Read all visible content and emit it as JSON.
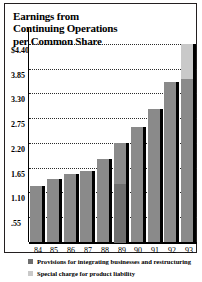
{
  "chart_data": {
    "type": "bar",
    "title": "Earnings from Continuing Operations per Common Share",
    "title_lines": [
      "Earnings from",
      "Continuing Operations",
      "per Common Share"
    ],
    "xlabel": "",
    "ylabel": "",
    "categories": [
      "84",
      "85",
      "86",
      "87",
      "88",
      "89",
      "90",
      "91",
      "92",
      "93"
    ],
    "values": [
      1.25,
      1.4,
      1.52,
      1.58,
      1.85,
      2.2,
      2.55,
      2.95,
      3.55,
      4.4
    ],
    "ylim": [
      0,
      4.75
    ],
    "ytick_values": [
      0.55,
      1.1,
      1.65,
      2.2,
      2.75,
      3.3,
      3.85,
      4.4
    ],
    "ytick_labels": [
      ".55",
      "1.10",
      "1.65",
      "2.20",
      "2.75",
      "3.30",
      "3.85",
      "$4.40"
    ],
    "grid": true,
    "grid_style": "dotted",
    "legend_position": "below-axis",
    "series": [
      {
        "name": "Provisions for integrating businesses and restructuring",
        "color": "#6e6e6e",
        "segments": [
          {
            "category": "89",
            "from": 0.0,
            "to": 1.3
          }
        ]
      },
      {
        "name": "Special charge for product liability",
        "color": "#c9c9c9",
        "segments": [
          {
            "category": "93",
            "from": 3.62,
            "to": 4.4
          }
        ]
      }
    ],
    "bars": [
      {
        "year": "84",
        "total": 1.25,
        "base_color": "#8a8a8a"
      },
      {
        "year": "85",
        "total": 1.4,
        "base_color": "#8a8a8a"
      },
      {
        "year": "86",
        "total": 1.52,
        "base_color": "#8a8a8a"
      },
      {
        "year": "87",
        "total": 1.58,
        "base_color": "#8a8a8a"
      },
      {
        "year": "88",
        "total": 1.85,
        "base_color": "#8a8a8a"
      },
      {
        "year": "89",
        "total": 2.2,
        "base_color": "#8a8a8a"
      },
      {
        "year": "90",
        "total": 2.55,
        "base_color": "#8a8a8a"
      },
      {
        "year": "91",
        "total": 2.95,
        "base_color": "#8a8a8a"
      },
      {
        "year": "92",
        "total": 3.55,
        "base_color": "#8a8a8a"
      },
      {
        "year": "93",
        "total": 4.4,
        "base_color": "#8a8a8a"
      }
    ]
  },
  "legend": {
    "items": [
      {
        "label": "Provisions for integrating businesses and restructuring",
        "swatch": "dark"
      },
      {
        "label": "Special charge for product liability",
        "swatch": "light"
      }
    ]
  },
  "colors": {
    "bar": "#8a8a8a",
    "bar_shadow": "#000000",
    "provisions": "#6e6e6e",
    "special_charge": "#c9c9c9",
    "grid": "#2b2b2b",
    "axis": "#000000",
    "frame": "#231f20",
    "background": "#ffffff"
  }
}
